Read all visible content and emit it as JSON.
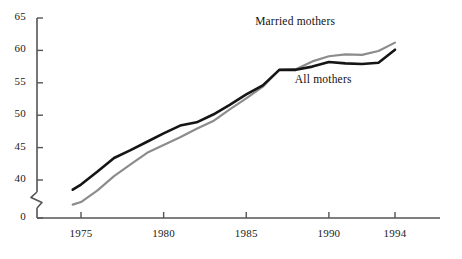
{
  "chart_data": {
    "type": "line",
    "title": "",
    "subtitle": "",
    "xlabel": "",
    "ylabel": "",
    "xlim": [
      1974.5,
      1994.5
    ],
    "ylim": [
      36,
      65
    ],
    "y_axis_break": true,
    "y_break_between": [
      0,
      40
    ],
    "grid": false,
    "legend_position": "inline-labels",
    "x_ticks": [
      1975,
      1980,
      1985,
      1990,
      1994
    ],
    "x_tick_labels": [
      "1975",
      "1980",
      "1985",
      "1990",
      "1994"
    ],
    "y_ticks": [
      0,
      40,
      45,
      50,
      55,
      60,
      65
    ],
    "y_tick_labels": [
      "0",
      "40",
      "45",
      "50",
      "55",
      "60",
      "65"
    ],
    "x": [
      1974.5,
      1975,
      1976,
      1977,
      1978,
      1979,
      1980,
      1981,
      1982,
      1983,
      1984,
      1985,
      1986,
      1987,
      1988,
      1989,
      1990,
      1991,
      1992,
      1993,
      1994
    ],
    "series": [
      {
        "name": "Married mothers",
        "color": "#8c8c8c",
        "label_x": 1988.2,
        "label_y": 64.2,
        "values": [
          36.2,
          36.6,
          38.4,
          40.6,
          42.4,
          44.2,
          45.4,
          46.6,
          47.9,
          49.1,
          50.9,
          52.6,
          54.4,
          57.0,
          57.1,
          58.3,
          59.1,
          59.4,
          59.3,
          59.9,
          61.2
        ]
      },
      {
        "name": "All mothers",
        "color": "#151515",
        "label_x": 1990.6,
        "label_y": 55.3,
        "values": [
          38.5,
          39.3,
          41.3,
          43.4,
          44.6,
          45.9,
          47.2,
          48.4,
          48.9,
          50.1,
          51.6,
          53.2,
          54.6,
          57.0,
          57.0,
          57.5,
          58.2,
          58.0,
          57.9,
          58.1,
          60.1
        ]
      }
    ]
  }
}
